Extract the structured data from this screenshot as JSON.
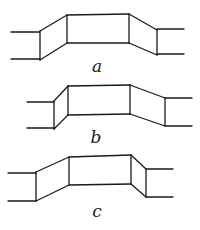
{
  "figures": [
    {
      "id": "a",
      "label": "a",
      "label_pos": [
        97,
        72
      ],
      "left_stub": {
        "x1": 11,
        "x2": 40,
        "y_top": 32,
        "y_bot": 59
      },
      "left_joint": {
        "x": 40,
        "top": 31,
        "bot": 60
      },
      "box": {
        "x1": 67,
        "x2": 129,
        "top_left": 15,
        "bot_left": 43,
        "top_right": 14,
        "bot_right": 43
      },
      "right_joint": {
        "x": 157,
        "top": 30,
        "bot": 55
      },
      "right_stub": {
        "x1": 157,
        "x2": 184,
        "y_top": 29,
        "y_bot": 54
      }
    },
    {
      "id": "b",
      "label": "b",
      "label_pos": [
        96,
        143
      ],
      "left_stub": {
        "x1": 27,
        "x2": 54,
        "y_top": 102,
        "y_bot": 128
      },
      "left_joint": {
        "x": 54,
        "top": 101,
        "bot": 129
      },
      "box": {
        "x1": 68,
        "x2": 130,
        "top_left": 86,
        "bot_left": 115,
        "top_right": 85,
        "bot_right": 114
      },
      "right_joint": {
        "x": 165,
        "top": 98,
        "bot": 126
      },
      "right_stub": {
        "x1": 165,
        "x2": 192,
        "y_top": 98,
        "y_bot": 126
      }
    },
    {
      "id": "c",
      "label": "c",
      "label_pos": [
        97,
        217
      ],
      "left_stub": {
        "x1": 8,
        "x2": 36,
        "y_top": 173,
        "y_bot": 201
      },
      "left_joint": {
        "x": 36,
        "top": 172,
        "bot": 201
      },
      "box": {
        "x1": 69,
        "x2": 131,
        "top_left": 157,
        "bot_left": 185,
        "top_right": 155,
        "bot_right": 184
      },
      "right_joint": {
        "x": 146,
        "top": 169,
        "bot": 197
      },
      "right_stub": {
        "x1": 146,
        "x2": 173,
        "y_top": 169,
        "y_bot": 197
      }
    }
  ]
}
